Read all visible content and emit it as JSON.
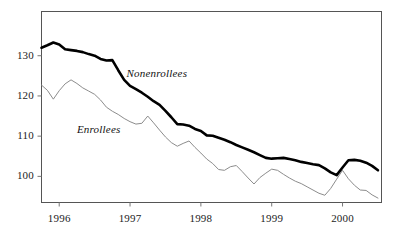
{
  "chart_data": {
    "type": "line",
    "title": "",
    "subtitle": "",
    "xlabel": "",
    "ylabel": "",
    "xlim": [
      1995.75,
      2000.55
    ],
    "ylim": [
      93.5,
      141.0
    ],
    "grid": false,
    "legend_position": "inline-annotation",
    "x_tick_labels": [
      "1996",
      "1997",
      "1998",
      "1999",
      "2000"
    ],
    "x_tick_values": [
      1996,
      1997,
      1998,
      1999,
      2000
    ],
    "y_tick_labels": [
      "100",
      "110",
      "120",
      "130"
    ],
    "y_tick_values": [
      100,
      110,
      120,
      130
    ],
    "x": [
      1995.75,
      1995.833,
      1995.917,
      1996.0,
      1996.083,
      1996.167,
      1996.25,
      1996.333,
      1996.417,
      1996.5,
      1996.583,
      1996.667,
      1996.75,
      1996.833,
      1996.917,
      1997.0,
      1997.083,
      1997.167,
      1997.25,
      1997.333,
      1997.417,
      1997.5,
      1997.583,
      1997.667,
      1997.75,
      1997.833,
      1997.917,
      1998.0,
      1998.083,
      1998.167,
      1998.25,
      1998.333,
      1998.417,
      1998.5,
      1998.583,
      1998.667,
      1998.75,
      1998.833,
      1998.917,
      1999.0,
      1999.083,
      1999.167,
      1999.25,
      1999.333,
      1999.417,
      1999.5,
      1999.583,
      1999.667,
      1999.75,
      1999.833,
      1999.917,
      2000.0,
      2000.083,
      2000.167,
      2000.25,
      2000.333,
      2000.417,
      2000.5
    ],
    "series": [
      {
        "name": "Nonenrollees",
        "label": "Nonenrollees",
        "style": "thick-black-line",
        "color": "#000000",
        "linewidth": 2.6,
        "values": [
          132.0,
          132.6,
          133.3,
          132.8,
          131.6,
          131.4,
          131.2,
          130.9,
          130.4,
          130.0,
          129.2,
          128.8,
          128.9,
          126.4,
          124.0,
          122.5,
          121.7,
          120.8,
          119.8,
          118.7,
          117.8,
          116.3,
          114.7,
          113.0,
          112.9,
          112.6,
          111.8,
          111.3,
          110.2,
          110.1,
          109.6,
          109.1,
          108.5,
          107.8,
          107.2,
          106.6,
          106.0,
          105.3,
          104.6,
          104.4,
          104.5,
          104.6,
          104.3,
          104.0,
          103.6,
          103.3,
          103.0,
          102.8,
          102.0,
          101.0,
          100.3,
          102.2,
          104.0,
          104.1,
          103.9,
          103.4,
          102.6,
          101.5
        ]
      },
      {
        "name": "Enrollees",
        "label": "Enrollees",
        "style": "thin-gray-line",
        "color": "#8c8c8c",
        "linewidth": 1.0,
        "values": [
          122.7,
          121.4,
          119.2,
          121.3,
          123.0,
          124.0,
          123.1,
          122.0,
          121.2,
          120.4,
          119.0,
          117.2,
          116.2,
          115.4,
          114.4,
          113.6,
          113.0,
          113.2,
          115.0,
          113.3,
          111.5,
          109.8,
          108.4,
          107.5,
          108.2,
          108.8,
          107.2,
          105.8,
          104.3,
          103.2,
          101.7,
          101.5,
          102.4,
          102.7,
          101.2,
          99.6,
          98.1,
          99.7,
          100.8,
          101.8,
          101.5,
          100.5,
          99.6,
          98.8,
          98.2,
          97.4,
          96.6,
          95.8,
          95.3,
          97.0,
          99.3,
          101.5,
          99.4,
          97.8,
          96.6,
          96.5,
          95.4,
          94.6
        ]
      }
    ],
    "annotations": [
      {
        "text": "Nonenrollees",
        "x": 1996.95,
        "y": 125.5
      },
      {
        "text": "Enrollees",
        "x": 1996.25,
        "y": 111.5
      }
    ]
  },
  "axes": {
    "frame_color": "#555555",
    "tick_color": "#777777",
    "background": "#ffffff"
  }
}
